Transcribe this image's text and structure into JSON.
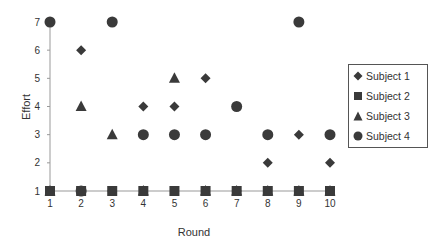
{
  "chart_data": {
    "type": "scatter",
    "title": "",
    "xlabel": "Round",
    "ylabel": "Effort",
    "x": [
      1,
      2,
      3,
      4,
      5,
      6,
      7,
      8,
      9,
      10
    ],
    "xlim": [
      1,
      10
    ],
    "ylim": [
      1,
      7
    ],
    "xticks": [
      "1",
      "2",
      "3",
      "4",
      "5",
      "6",
      "7",
      "8",
      "9",
      "10"
    ],
    "yticks": [
      "1",
      "2",
      "3",
      "4",
      "5",
      "6",
      "7"
    ],
    "grid": false,
    "legend_position": "right",
    "series": [
      {
        "name": "Subject 1",
        "marker": "diamond",
        "values": [
          7,
          6,
          1,
          4,
          4,
          5,
          1,
          2,
          3,
          2
        ]
      },
      {
        "name": "Subject 2",
        "marker": "square",
        "values": [
          1,
          1,
          1,
          1,
          1,
          1,
          1,
          1,
          1,
          1
        ]
      },
      {
        "name": "Subject 3",
        "marker": "triangle",
        "values": [
          1,
          4,
          3,
          1,
          5,
          1,
          1,
          1,
          1,
          1
        ]
      },
      {
        "name": "Subject 4",
        "marker": "circle",
        "values": [
          7,
          1,
          7,
          3,
          3,
          3,
          4,
          3,
          7,
          3
        ]
      }
    ]
  },
  "legend": {
    "items": [
      "Subject 1",
      "Subject 2",
      "Subject 3",
      "Subject 4"
    ]
  },
  "colors": {
    "marker": "#3a3a3a",
    "axis": "#999999"
  }
}
